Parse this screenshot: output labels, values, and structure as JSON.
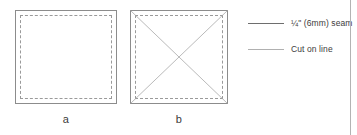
{
  "figure": {
    "width": 357,
    "height": 135,
    "background": "#ffffff"
  },
  "diagrams": [
    {
      "id": "square-a",
      "label": "a",
      "x": 15,
      "y": 10,
      "width": 102,
      "height": 94,
      "outer_line": "solid",
      "outer_color": "#8c8c8c",
      "inner_line": "dashed",
      "inner_color": "#9a9a9a",
      "inner_inset": 5,
      "has_diagonals": false
    },
    {
      "id": "square-b",
      "label": "b",
      "x": 130,
      "y": 10,
      "width": 98,
      "height": 94,
      "outer_line": "solid",
      "outer_color": "#8c8c8c",
      "inner_line": "dashed",
      "inner_color": "#9a9a9a",
      "inner_inset": 5,
      "has_diagonals": true,
      "diagonal_color": "#a8a8a8"
    }
  ],
  "legend": {
    "x": 248,
    "items": [
      {
        "id": "seam-allowance",
        "label": "¼\" (6mm) seam",
        "line_color": "#6e6e6e",
        "line_width": 1.6,
        "line_style": "solid",
        "y": 24
      },
      {
        "id": "cut-line",
        "label": "Cut on line",
        "line_color": "#b0b0b0",
        "line_width": 1.2,
        "line_style": "solid",
        "y": 50
      }
    ]
  },
  "page_rule": {
    "x": 350,
    "color": "#b3b3b3"
  }
}
